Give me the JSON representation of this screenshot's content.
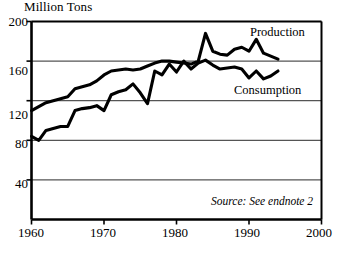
{
  "chart_data": {
    "type": "line",
    "title": "",
    "ylabel": "Million Tons",
    "xlabel": "",
    "ylim": [
      0,
      200
    ],
    "xlim": [
      1960,
      2000
    ],
    "yticks": [
      "200",
      "160",
      "120",
      "80",
      "40"
    ],
    "ytick_values": [
      200,
      160,
      120,
      80,
      40
    ],
    "xticks": [
      "1960",
      "1970",
      "1980",
      "1990",
      "2000"
    ],
    "xtick_values": [
      1960,
      1970,
      1980,
      1990,
      2000
    ],
    "grid": "horizontal",
    "legend_position": "inline-annotation",
    "annotations": [
      "Source: See endnote 2"
    ],
    "x": [
      1960,
      1961,
      1962,
      1963,
      1964,
      1965,
      1966,
      1967,
      1968,
      1969,
      1970,
      1971,
      1972,
      1973,
      1974,
      1975,
      1976,
      1977,
      1978,
      1979,
      1980,
      1981,
      1982,
      1983,
      1984,
      1985,
      1986,
      1987,
      1988,
      1989,
      1990,
      1991,
      1992,
      1993,
      1994
    ],
    "series": [
      {
        "name": "Production",
        "values": [
          110,
          114,
          118,
          120,
          122,
          124,
          132,
          134,
          136,
          140,
          146,
          150,
          151,
          152,
          151,
          152,
          155,
          158,
          160,
          160,
          159,
          158,
          157,
          160,
          188,
          170,
          167,
          166,
          172,
          174,
          170,
          182,
          168,
          165,
          162
        ]
      },
      {
        "name": "Consumption",
        "values": [
          84,
          80,
          90,
          92,
          94,
          94,
          110,
          112,
          113,
          115,
          110,
          126,
          129,
          131,
          137,
          128,
          117,
          150,
          146,
          157,
          149,
          160,
          152,
          158,
          161,
          156,
          152,
          153,
          154,
          152,
          143,
          150,
          142,
          145,
          150
        ]
      }
    ]
  },
  "axes": {
    "ylabel_text": "Million Tons"
  },
  "labels": {
    "production": "Production",
    "consumption": "Consumption"
  },
  "source": {
    "note": "Source: See endnote 2"
  },
  "colors": {
    "line": "#000000",
    "grid": "#555555",
    "axis": "#000000",
    "background": "#ffffff"
  }
}
